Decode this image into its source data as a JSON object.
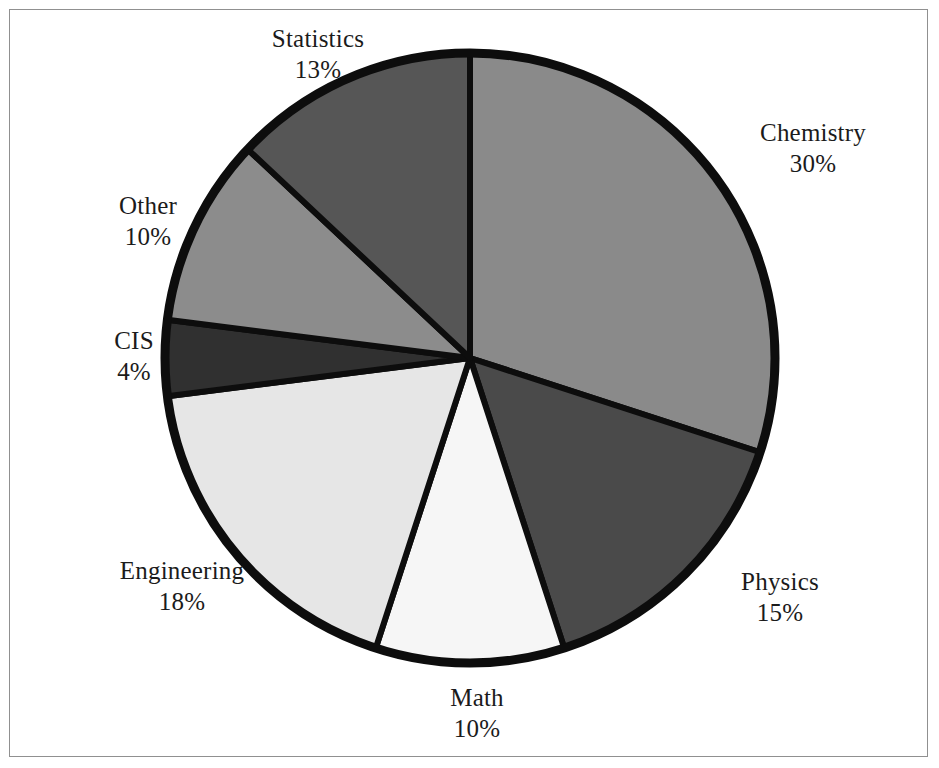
{
  "figure": {
    "background_color": "#ffffff",
    "frame_color": "#909090",
    "outline_color": "#0d0d0d"
  },
  "chart_data": {
    "type": "pie",
    "title": "",
    "subtitle": "",
    "xlabel": "",
    "ylabel": "",
    "legend_position": "none",
    "grid": false,
    "labels_outside": true,
    "start_angle_deg": 0,
    "direction": "clockwise",
    "categories": [
      "Chemistry",
      "Physics",
      "Math",
      "Engineering",
      "CIS",
      "Other",
      "Statistics"
    ],
    "values": [
      30,
      15,
      10,
      18,
      4,
      10,
      13
    ],
    "value_unit": "%",
    "total": 100,
    "slices": [
      {
        "name": "Chemistry",
        "label": "Chemistry",
        "value": 30,
        "value_text": "30%",
        "color": "#8a8a8a",
        "start_angle": 0,
        "end_angle": 108
      },
      {
        "name": "Physics",
        "label": "Physics",
        "value": 15,
        "value_text": "15%",
        "color": "#4a4a4a",
        "start_angle": 108,
        "end_angle": 162
      },
      {
        "name": "Math",
        "label": "Math",
        "value": 10,
        "value_text": "10%",
        "color": "#f6f6f6",
        "start_angle": 162,
        "end_angle": 198
      },
      {
        "name": "Engineering",
        "label": "Engineering",
        "value": 18,
        "value_text": "18%",
        "color": "#e6e6e6",
        "start_angle": 198,
        "end_angle": 262.8
      },
      {
        "name": "CIS",
        "label": "CIS",
        "value": 4,
        "value_text": "4%",
        "color": "#303030",
        "start_angle": 262.8,
        "end_angle": 277.2
      },
      {
        "name": "Other",
        "label": "Other",
        "value": 10,
        "value_text": "10%",
        "color": "#8c8c8c",
        "start_angle": 277.2,
        "end_angle": 313.2
      },
      {
        "name": "Statistics",
        "label": "Statistics",
        "value": 13,
        "value_text": "13%",
        "color": "#565656",
        "start_angle": 313.2,
        "end_angle": 360
      }
    ]
  }
}
